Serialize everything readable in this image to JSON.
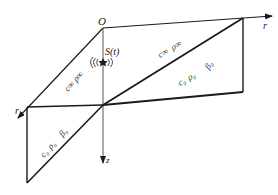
{
  "diagram": {
    "type": "layered-medium-geometry",
    "colors": {
      "line": "#1a1a1a",
      "background": "#ffffff"
    },
    "axes": {
      "origin_label": "O",
      "r_right_label": "r",
      "r_left_label": "r",
      "z_label": "z"
    },
    "source": {
      "label": "S(t)",
      "icon": "source-wave-icon"
    },
    "regions": {
      "upper_right_top": {
        "c": "c∞",
        "rho": "ρ∞"
      },
      "upper_right_bottom": {
        "c": "c₀",
        "rho": "ρ₀",
        "beta": "β₀"
      },
      "left_top": {
        "c": "c∞",
        "rho": "ρ∞"
      },
      "left_bottom": {
        "c": "c₀",
        "rho": "ρ₀",
        "beta": "β₀"
      }
    }
  }
}
